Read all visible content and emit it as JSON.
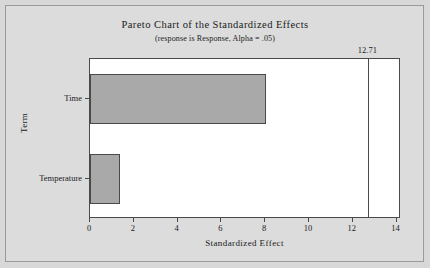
{
  "chart_data": {
    "type": "bar",
    "orientation": "horizontal",
    "title": "Pareto Chart of the Standardized Effects",
    "subtitle": "(response is Response, Alpha = .05)",
    "xlabel": "Standardized Effect",
    "ylabel": "Term",
    "categories": [
      "Time",
      "Temperature"
    ],
    "values": [
      8.05,
      1.35
    ],
    "xlim": [
      0,
      14.2
    ],
    "xticks": [
      0,
      2,
      4,
      6,
      8,
      10,
      12,
      14
    ],
    "xtick_labels": [
      "0",
      "2",
      "4",
      "6",
      "8",
      "10",
      "12",
      "14"
    ],
    "grid": false,
    "legend": false,
    "reference_line": {
      "value": 12.71,
      "label": "12.71"
    },
    "colors": {
      "bar_fill": "#a9a9a9",
      "bar_edge": "#4a4a4a",
      "plot_background": "#ffffff",
      "figure_background": "#d8d8d8",
      "axis": "#4a4a4a",
      "text": "#1a1a1a"
    }
  }
}
